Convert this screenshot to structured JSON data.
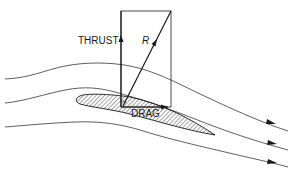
{
  "diagram": {
    "title": "",
    "type": "force-diagram",
    "labels": {
      "thrust": "THRUST",
      "resultant": "R",
      "drag": "DRAG"
    },
    "colors": {
      "line": "#1a1a1a",
      "background": "#ffffff"
    },
    "elements": [
      {
        "id": "airfoil",
        "kind": "hatched-airfoil"
      },
      {
        "id": "force-rectangle",
        "kind": "parallelogram-of-forces"
      },
      {
        "id": "thrust-vector",
        "kind": "arrow",
        "direction": "up"
      },
      {
        "id": "resultant-vector",
        "kind": "arrow",
        "direction": "up-right"
      },
      {
        "id": "drag-vector",
        "kind": "arrow",
        "direction": "right"
      },
      {
        "id": "streamlines",
        "kind": "curves",
        "count": 3,
        "direction": "left-to-right"
      }
    ]
  }
}
